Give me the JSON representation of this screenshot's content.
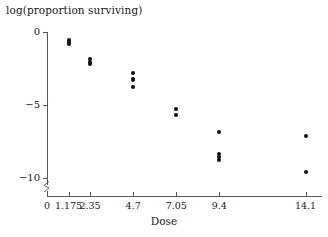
{
  "chart_data": {
    "type": "scatter",
    "title": "",
    "xlabel": "Dose",
    "ylabel": "log(proportion surviving)",
    "xlim": [
      0,
      15.0
    ],
    "ylim": [
      -11.2,
      0.6
    ],
    "grid": false,
    "legend": null,
    "x_ticks": [
      {
        "value": 0,
        "label": "0"
      },
      {
        "value": 1.175,
        "label": "1.175"
      },
      {
        "value": 2.35,
        "label": "2.35"
      },
      {
        "value": 4.7,
        "label": "4.7"
      },
      {
        "value": 7.05,
        "label": "7.05"
      },
      {
        "value": 9.4,
        "label": "9.4"
      },
      {
        "value": 14.1,
        "label": "14.1"
      }
    ],
    "y_ticks": [
      {
        "value": 0,
        "label": "0"
      },
      {
        "value": -5,
        "label": "−5"
      },
      {
        "value": -10,
        "label": "−10"
      }
    ],
    "axis_break_y": true,
    "marker": {
      "shape": "circle",
      "color": "#111111",
      "size": 4
    },
    "points": [
      {
        "x": 1.175,
        "y": -0.55
      },
      {
        "x": 1.175,
        "y": -0.7
      },
      {
        "x": 1.175,
        "y": -0.85
      },
      {
        "x": 2.35,
        "y": -1.85
      },
      {
        "x": 2.35,
        "y": -2.05
      },
      {
        "x": 2.35,
        "y": -2.2
      },
      {
        "x": 4.7,
        "y": -2.8
      },
      {
        "x": 4.7,
        "y": -3.2
      },
      {
        "x": 4.7,
        "y": -3.3
      },
      {
        "x": 4.7,
        "y": -3.8
      },
      {
        "x": 7.05,
        "y": -5.25
      },
      {
        "x": 7.05,
        "y": -5.7
      },
      {
        "x": 9.4,
        "y": -6.85
      },
      {
        "x": 9.4,
        "y": -8.35
      },
      {
        "x": 9.4,
        "y": -8.55
      },
      {
        "x": 9.4,
        "y": -8.75
      },
      {
        "x": 14.1,
        "y": -7.1
      },
      {
        "x": 14.1,
        "y": -9.6
      }
    ]
  }
}
